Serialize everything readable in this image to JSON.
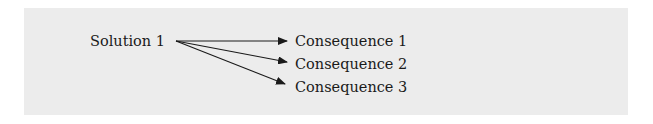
{
  "diagram": {
    "source": {
      "label": "Solution 1"
    },
    "targets": [
      {
        "label": "Consequence 1"
      },
      {
        "label": "Consequence 2"
      },
      {
        "label": "Consequence 3"
      }
    ],
    "colors": {
      "panel_background": "#ececec",
      "text": "#1a1a1a",
      "arrow": "#1a1a1a"
    }
  }
}
